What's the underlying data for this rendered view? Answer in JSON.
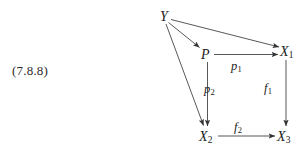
{
  "figure": {
    "equation_number": "(7.8.8)",
    "type": "commutative-diagram",
    "background_color": "#ffffff",
    "ink_color": "#1c1c1c"
  },
  "nodes": [
    {
      "id": "Y",
      "base": "Y",
      "sub": "",
      "x": 166,
      "y": 17
    },
    {
      "id": "P",
      "base": "P",
      "sub": "",
      "x": 206,
      "y": 55
    },
    {
      "id": "X1",
      "base": "X",
      "sub": "1",
      "x": 286,
      "y": 52
    },
    {
      "id": "X2",
      "base": "X",
      "sub": "2",
      "x": 206,
      "y": 137
    },
    {
      "id": "X3",
      "base": "X",
      "sub": "3",
      "x": 284,
      "y": 137
    }
  ],
  "edges": [
    {
      "id": "Y-P",
      "from": "Y",
      "to": "P",
      "label_base": "",
      "label_sub": ""
    },
    {
      "id": "Y-X1",
      "from": "Y",
      "to": "X1",
      "label_base": "",
      "label_sub": ""
    },
    {
      "id": "Y-X2",
      "from": "Y",
      "to": "X2",
      "label_base": "",
      "label_sub": ""
    },
    {
      "id": "P-X1",
      "from": "P",
      "to": "X1",
      "label_base": "p",
      "label_sub": "1"
    },
    {
      "id": "P-X2",
      "from": "P",
      "to": "X2",
      "label_base": "p",
      "label_sub": "2"
    },
    {
      "id": "X1-X3",
      "from": "X1",
      "to": "X3",
      "label_base": "f",
      "label_sub": "1"
    },
    {
      "id": "X2-X3",
      "from": "X2",
      "to": "X3",
      "label_base": "f",
      "label_sub": "2"
    }
  ],
  "labels": {
    "p1": {
      "base": "p",
      "sub": "1"
    },
    "p2": {
      "base": "p",
      "sub": "2"
    },
    "f1": {
      "base": "f",
      "sub": "1"
    },
    "f2": {
      "base": "f",
      "sub": "2"
    }
  }
}
